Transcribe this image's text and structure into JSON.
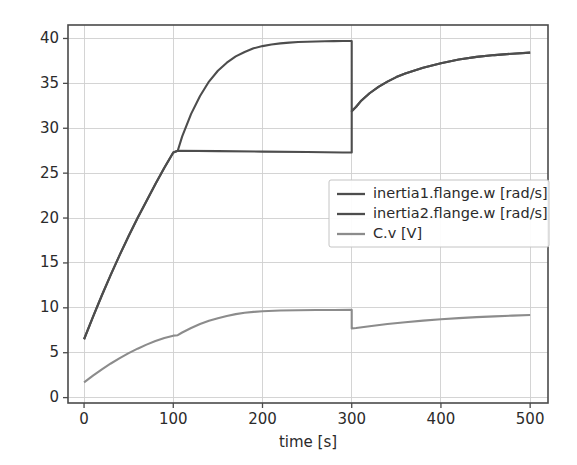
{
  "chart_data": {
    "type": "line",
    "title": "",
    "xlabel": "time [s]",
    "ylabel": "",
    "xlim": [
      -18,
      520
    ],
    "ylim": [
      -0.6,
      41.5
    ],
    "grid": true,
    "legend_position": "center-right inside axes",
    "xticks": [
      0,
      100,
      200,
      300,
      400,
      500
    ],
    "yticks": [
      0,
      5,
      10,
      15,
      20,
      25,
      30,
      35,
      40
    ],
    "xtick_labels": [
      "0",
      "100",
      "200",
      "300",
      "400",
      "500"
    ],
    "ytick_labels": [
      "0",
      "5",
      "10",
      "15",
      "20",
      "25",
      "30",
      "35",
      "40"
    ],
    "series": [
      {
        "name": "inertia1.flange.w [rad/s]",
        "color": "#4d4d4d",
        "x": [
          0,
          10,
          20,
          30,
          40,
          50,
          60,
          70,
          80,
          90,
          100,
          105,
          110,
          120,
          130,
          140,
          150,
          160,
          170,
          180,
          190,
          200,
          210,
          220,
          230,
          240,
          250,
          260,
          270,
          280,
          290,
          300,
          300,
          305,
          310,
          320,
          330,
          340,
          350,
          360,
          380,
          400,
          420,
          440,
          460,
          480,
          500
        ],
        "y": [
          6.5,
          9.0,
          11.4,
          13.7,
          15.9,
          18.0,
          20.0,
          21.9,
          23.8,
          25.6,
          27.3,
          27.5,
          29.1,
          31.6,
          33.6,
          35.2,
          36.4,
          37.3,
          38.0,
          38.5,
          38.9,
          39.15,
          39.33,
          39.45,
          39.54,
          39.6,
          39.64,
          39.67,
          39.69,
          39.7,
          39.71,
          39.72,
          31.9,
          32.4,
          33.0,
          33.9,
          34.6,
          35.2,
          35.7,
          36.1,
          36.75,
          37.25,
          37.65,
          37.95,
          38.15,
          38.3,
          38.42
        ]
      },
      {
        "name": "inertia2.flange.w [rad/s]",
        "color": "#4d4d4d",
        "x": [
          0,
          10,
          20,
          30,
          40,
          50,
          60,
          70,
          80,
          90,
          100,
          105,
          150,
          200,
          250,
          290,
          300,
          300,
          305,
          310,
          320,
          330,
          340,
          350,
          360,
          380,
          400,
          420,
          440,
          460,
          480,
          500
        ],
        "y": [
          6.5,
          9.0,
          11.4,
          13.7,
          15.9,
          18.0,
          20.0,
          21.9,
          23.8,
          25.6,
          27.3,
          27.5,
          27.45,
          27.4,
          27.35,
          27.3,
          27.3,
          31.9,
          32.4,
          33.0,
          33.9,
          34.6,
          35.2,
          35.7,
          36.1,
          36.75,
          37.25,
          37.65,
          37.95,
          38.15,
          38.3,
          38.42
        ]
      },
      {
        "name": "C.v [V]",
        "color": "#8c8c8c",
        "x": [
          0,
          10,
          20,
          30,
          40,
          50,
          60,
          70,
          80,
          90,
          100,
          105,
          110,
          120,
          130,
          140,
          150,
          160,
          170,
          180,
          190,
          200,
          220,
          240,
          260,
          280,
          300,
          300,
          305,
          320,
          340,
          360,
          380,
          400,
          420,
          440,
          460,
          480,
          500
        ],
        "y": [
          1.7,
          2.45,
          3.15,
          3.8,
          4.4,
          4.95,
          5.45,
          5.9,
          6.3,
          6.65,
          6.9,
          6.95,
          7.25,
          7.75,
          8.2,
          8.55,
          8.85,
          9.1,
          9.3,
          9.45,
          9.55,
          9.62,
          9.7,
          9.73,
          9.75,
          9.76,
          9.77,
          7.7,
          7.75,
          7.95,
          8.2,
          8.4,
          8.58,
          8.72,
          8.85,
          8.96,
          9.05,
          9.13,
          9.2
        ]
      }
    ]
  },
  "legend": {
    "entries": [
      {
        "label": "inertia1.flange.w [rad/s]"
      },
      {
        "label": "inertia2.flange.w [rad/s]"
      },
      {
        "label": "C.v [V]"
      }
    ]
  },
  "colors": {
    "series_dark": "#4d4d4d",
    "series_light": "#8c8c8c",
    "grid": "#cfcfcf",
    "axis": "#4a4a4a",
    "background": "#ffffff"
  }
}
